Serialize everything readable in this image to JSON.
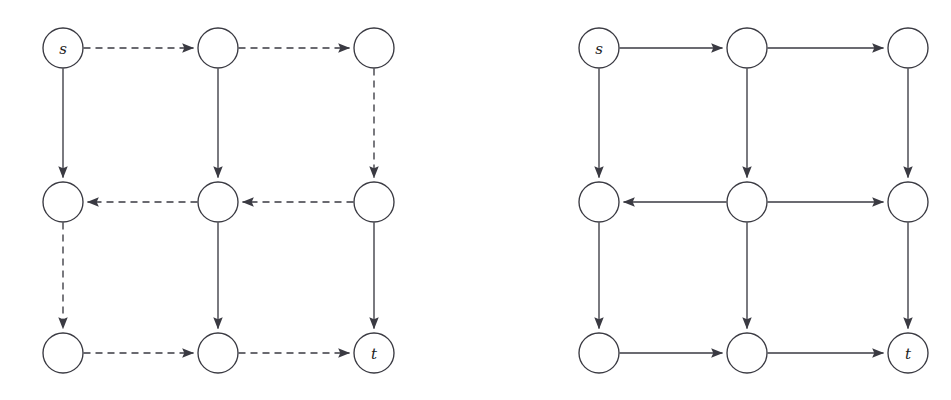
{
  "figure": {
    "title": "",
    "background_color": "#ffffff",
    "stroke_color": "#3a3a42",
    "node_fill_color": "#ffffff",
    "label_color": "#1d1d22",
    "width": 951,
    "height": 400
  },
  "panels": [
    {
      "id": "left-panel",
      "name": "residual-graph-dashed",
      "node_radius": 20,
      "columns_x": [
        63,
        218,
        374
      ],
      "rows_y": [
        48,
        202,
        353
      ],
      "nodes": [
        {
          "id": "n00",
          "label": "s",
          "col": 0,
          "row": 0,
          "cx": 63,
          "cy": 48
        },
        {
          "id": "n10",
          "label": "",
          "col": 1,
          "row": 0,
          "cx": 218,
          "cy": 48
        },
        {
          "id": "n20",
          "label": "",
          "col": 2,
          "row": 0,
          "cx": 374,
          "cy": 48
        },
        {
          "id": "n01",
          "label": "",
          "col": 0,
          "row": 1,
          "cx": 63,
          "cy": 202
        },
        {
          "id": "n11",
          "label": "",
          "col": 1,
          "row": 1,
          "cx": 218,
          "cy": 202
        },
        {
          "id": "n21",
          "label": "",
          "col": 2,
          "row": 1,
          "cx": 374,
          "cy": 202
        },
        {
          "id": "n02",
          "label": "",
          "col": 0,
          "row": 2,
          "cx": 63,
          "cy": 353
        },
        {
          "id": "n12",
          "label": "",
          "col": 1,
          "row": 2,
          "cx": 218,
          "cy": 353
        },
        {
          "id": "n22",
          "label": "t",
          "col": 2,
          "row": 2,
          "cx": 374,
          "cy": 353
        }
      ],
      "edges": [
        {
          "from": "n00",
          "to": "n10",
          "style": "dashed",
          "direction": "right"
        },
        {
          "from": "n10",
          "to": "n20",
          "style": "dashed",
          "direction": "right"
        },
        {
          "from": "n21",
          "to": "n11",
          "style": "dashed",
          "direction": "left"
        },
        {
          "from": "n11",
          "to": "n01",
          "style": "dashed",
          "direction": "left"
        },
        {
          "from": "n02",
          "to": "n12",
          "style": "dashed",
          "direction": "right"
        },
        {
          "from": "n12",
          "to": "n22",
          "style": "dashed",
          "direction": "right"
        },
        {
          "from": "n00",
          "to": "n01",
          "style": "solid",
          "direction": "down"
        },
        {
          "from": "n01",
          "to": "n02",
          "style": "dashed",
          "direction": "down"
        },
        {
          "from": "n10",
          "to": "n11",
          "style": "solid",
          "direction": "down"
        },
        {
          "from": "n11",
          "to": "n12",
          "style": "solid",
          "direction": "down"
        },
        {
          "from": "n20",
          "to": "n21",
          "style": "dashed",
          "direction": "down"
        },
        {
          "from": "n21",
          "to": "n22",
          "style": "solid",
          "direction": "down"
        }
      ]
    },
    {
      "id": "right-panel",
      "name": "flow-graph-solid",
      "node_radius": 20,
      "columns_x": [
        599,
        747,
        908
      ],
      "rows_y": [
        48,
        202,
        353
      ],
      "nodes": [
        {
          "id": "m00",
          "label": "s",
          "col": 0,
          "row": 0,
          "cx": 599,
          "cy": 48
        },
        {
          "id": "m10",
          "label": "",
          "col": 1,
          "row": 0,
          "cx": 747,
          "cy": 48
        },
        {
          "id": "m20",
          "label": "",
          "col": 2,
          "row": 0,
          "cx": 908,
          "cy": 48
        },
        {
          "id": "m01",
          "label": "",
          "col": 0,
          "row": 1,
          "cx": 599,
          "cy": 202
        },
        {
          "id": "m11",
          "label": "",
          "col": 1,
          "row": 1,
          "cx": 747,
          "cy": 202
        },
        {
          "id": "m21",
          "label": "",
          "col": 2,
          "row": 1,
          "cx": 908,
          "cy": 202
        },
        {
          "id": "m02",
          "label": "",
          "col": 0,
          "row": 2,
          "cx": 599,
          "cy": 353
        },
        {
          "id": "m12",
          "label": "",
          "col": 1,
          "row": 2,
          "cx": 747,
          "cy": 353
        },
        {
          "id": "m22",
          "label": "t",
          "col": 2,
          "row": 2,
          "cx": 908,
          "cy": 353
        }
      ],
      "edges": [
        {
          "from": "m00",
          "to": "m10",
          "style": "solid",
          "direction": "right"
        },
        {
          "from": "m10",
          "to": "m20",
          "style": "solid",
          "direction": "right"
        },
        {
          "from": "m11",
          "to": "m01",
          "style": "solid",
          "direction": "left"
        },
        {
          "from": "m11",
          "to": "m21",
          "style": "solid",
          "direction": "right"
        },
        {
          "from": "m02",
          "to": "m12",
          "style": "solid",
          "direction": "right"
        },
        {
          "from": "m12",
          "to": "m22",
          "style": "solid",
          "direction": "right"
        },
        {
          "from": "m00",
          "to": "m01",
          "style": "solid",
          "direction": "down"
        },
        {
          "from": "m01",
          "to": "m02",
          "style": "solid",
          "direction": "down"
        },
        {
          "from": "m10",
          "to": "m11",
          "style": "solid",
          "direction": "down"
        },
        {
          "from": "m11",
          "to": "m12",
          "style": "solid",
          "direction": "down"
        },
        {
          "from": "m20",
          "to": "m21",
          "style": "solid",
          "direction": "down"
        },
        {
          "from": "m21",
          "to": "m22",
          "style": "solid",
          "direction": "down"
        }
      ]
    }
  ]
}
